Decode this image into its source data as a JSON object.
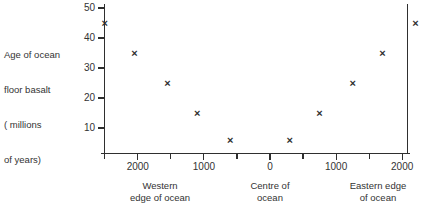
{
  "chart_data": {
    "type": "scatter",
    "title": "",
    "ylabel_lines": [
      "Age of ocean",
      "floor basalt",
      "( millions",
      "of years)"
    ],
    "ylabel": "Age of ocean floor basalt ( millions of years)",
    "xlabel": "",
    "ylim": [
      0,
      50
    ],
    "yticks": [
      10,
      20,
      30,
      40,
      50
    ],
    "ytick_labels": [
      "10",
      "20",
      "30",
      "40",
      "50"
    ],
    "grid": false,
    "legend": "none",
    "xtick_labels": [
      "2000",
      "1000",
      "0",
      "1000",
      "2000"
    ],
    "xtick_values": [
      -2000,
      -1000,
      0,
      1000,
      2000
    ],
    "x_minor_ticks": true,
    "x_categories": [
      {
        "lines": [
          "Western",
          "edge of ocean"
        ],
        "text": "Western edge of ocean"
      },
      {
        "lines": [
          "Centre of",
          "ocean"
        ],
        "text": "Centre of ocean"
      },
      {
        "lines": [
          "Eastern edge",
          "of ocean"
        ],
        "text": "Eastern edge of ocean"
      }
    ],
    "series": [
      {
        "name": "Age of ocean floor basalt",
        "marker": "x",
        "points": [
          {
            "x": -2500,
            "y": 45
          },
          {
            "x": -2050,
            "y": 35
          },
          {
            "x": -1550,
            "y": 25
          },
          {
            "x": -1100,
            "y": 15
          },
          {
            "x": -600,
            "y": 6
          },
          {
            "x": 300,
            "y": 6
          },
          {
            "x": 750,
            "y": 15
          },
          {
            "x": 1250,
            "y": 25
          },
          {
            "x": 1700,
            "y": 35
          },
          {
            "x": 2200,
            "y": 45
          }
        ]
      }
    ]
  },
  "colors": {
    "axis": "#2f2f2f",
    "text": "#333333",
    "marker": "#2f2f2f",
    "background": "#ffffff"
  }
}
